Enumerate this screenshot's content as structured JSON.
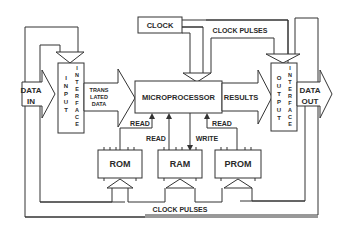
{
  "diagram": {
    "type": "block-diagram",
    "nodes": {
      "clock": {
        "label": "CLOCK"
      },
      "microprocessor": {
        "label": "MICROPROCESSOR"
      },
      "input_interface": {
        "label_left": "INPUT",
        "label_right": "INTERFACE"
      },
      "output_interface": {
        "label_left": "OUTPUT",
        "label_right": "INTERFACE"
      },
      "rom": {
        "label": "ROM"
      },
      "ram": {
        "label": "RAM"
      },
      "prom": {
        "label": "PROM"
      }
    },
    "labels": {
      "data_in_1": "DATA",
      "data_in_2": "IN",
      "data_out_1": "DATA",
      "data_out_2": "OUT",
      "translated_1": "TRANS",
      "translated_2": "LATED",
      "translated_3": "DATA",
      "results": "RESULTS",
      "clock_pulses_top": "CLOCK PULSES",
      "clock_pulses_bottom": "CLOCK PULSES",
      "rom_read": "READ",
      "ram_read": "READ",
      "ram_write": "WRITE",
      "prom_read": "READ"
    },
    "edges": [
      {
        "from": "DATA IN",
        "to": "input_interface"
      },
      {
        "from": "input_interface",
        "to": "microprocessor",
        "label": "TRANSLATED DATA"
      },
      {
        "from": "microprocessor",
        "to": "output_interface",
        "label": "RESULTS"
      },
      {
        "from": "output_interface",
        "to": "DATA OUT"
      },
      {
        "from": "clock",
        "to": "microprocessor"
      },
      {
        "from": "clock",
        "to": "output_interface",
        "label": "CLOCK PULSES"
      },
      {
        "from": "rom",
        "to": "microprocessor",
        "label": "READ"
      },
      {
        "from": "ram",
        "to": "microprocessor",
        "label": "READ"
      },
      {
        "from": "microprocessor",
        "to": "ram",
        "label": "WRITE"
      },
      {
        "from": "prom",
        "to": "microprocessor",
        "label": "READ"
      },
      {
        "from": "clock pulses bus",
        "to": "rom",
        "label": "CLOCK PULSES"
      },
      {
        "from": "clock pulses bus",
        "to": "ram"
      },
      {
        "from": "clock pulses bus",
        "to": "prom"
      },
      {
        "from": "clock pulses bus",
        "to": "input_interface"
      }
    ]
  }
}
